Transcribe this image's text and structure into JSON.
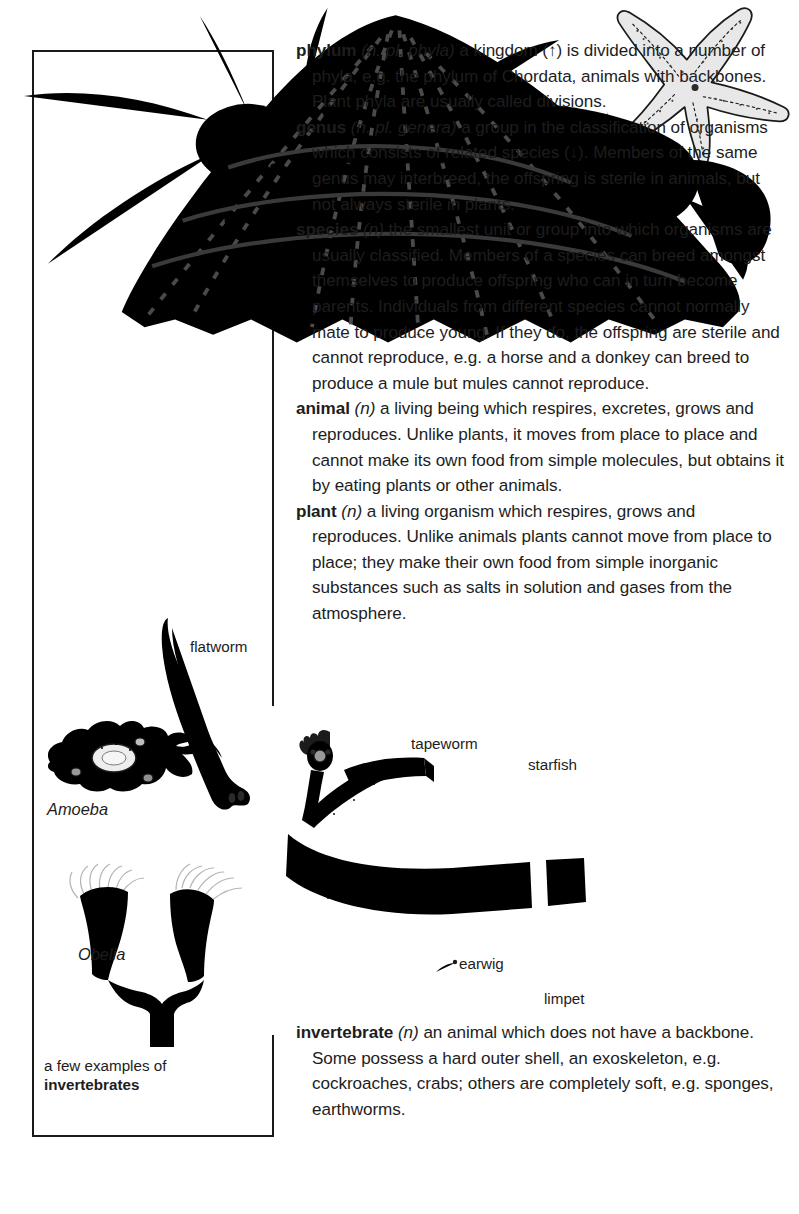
{
  "page": {
    "kind": "illustrated-dictionary-page",
    "background_color": "#ffffff",
    "ink_color": "#1a1a1a"
  },
  "entries": [
    {
      "headword": "phylum",
      "grammar": "(n. pl. phyla)",
      "definition": " a kingdom (↑) is divided into a number of phyla, e.g. the phylum of Chordata, animals with backbones. Plant phyla are usually called divisions."
    },
    {
      "headword": "genus",
      "grammar": "(n. pl. genera)",
      "definition": " a group in the classification of organisms which consists of related species (↓). Members of the same genus may interbreed, the offspring is sterile in animals, but not always sterile in plants."
    },
    {
      "headword": "species",
      "grammar": "(n)",
      "definition": " the smallest unit or group into which organisms are usually classified. Members of a species can breed amongst themselves to produce offspring who can in turn become parents. Individuals from different species cannot normally mate to produce young. If they do, the offspring are sterile and cannot reproduce, e.g. a horse and a donkey can breed to produce a mule but mules cannot reproduce."
    },
    {
      "headword": "animal",
      "grammar": "(n)",
      "definition": " a living being which respires, excretes, grows and reproduces. Unlike plants, it moves from place to place and cannot make its own food from simple molecules, but obtains it by eating plants or other animals."
    },
    {
      "headword": "plant",
      "grammar": "(n)",
      "definition": " a living organism which respires, grows and reproduces. Unlike animals plants cannot move from place to place; they make their own food from simple inorganic substances such as salts in solution and gases from the atmosphere."
    }
  ],
  "bottom_entries": [
    {
      "headword": "invertebrate",
      "grammar": "(n)",
      "definition": " an animal which does not have a backbone. Some possess a hard outer shell, an exoskeleton, e.g. cockroaches, crabs; others are completely soft, e.g. sponges, earthworms."
    }
  ],
  "figure": {
    "caption_line1": "a few examples of",
    "caption_line2": "invertebrates",
    "labels": {
      "flatworm": "flatworm",
      "amoeba": "Amoeba",
      "obelia": "Obelia",
      "tapeworm": "tapeworm",
      "starfish": "starfish",
      "earwig": "earwig",
      "limpet": "limpet"
    }
  }
}
